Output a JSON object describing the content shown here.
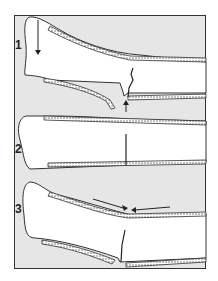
{
  "figure": {
    "panels": [
      {
        "label": "1",
        "description": "Bone with fracture; downward force arrow at proximal end, upward arrow at fracture site"
      },
      {
        "label": "2",
        "description": "Straight bone with crack line through mid-shaft"
      },
      {
        "label": "3",
        "description": "Bone with compression arrows pointing toward fracture site from opposite directions"
      }
    ],
    "colors": {
      "background": "#e6e6e6",
      "bone": "#ffffff",
      "outline": "#333333"
    }
  }
}
